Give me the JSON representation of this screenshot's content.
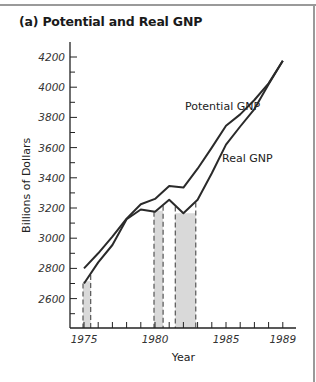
{
  "chart_data": {
    "type": "line",
    "title": "(a) Potential and Real GNP",
    "xlabel": "Year",
    "ylabel": "Billions of Dollars",
    "x": [
      1975,
      1976,
      1977,
      1978,
      1979,
      1980,
      1981,
      1982,
      1983,
      1984,
      1985,
      1986,
      1987,
      1988,
      1989
    ],
    "x_tick_labels": [
      "1975",
      "1980",
      "1985",
      "1989"
    ],
    "y_tick_labels": [
      "2600",
      "2800",
      "3000",
      "3200",
      "3400",
      "3600",
      "3800",
      "4000",
      "4200"
    ],
    "ylim": [
      2400,
      4300
    ],
    "xlim": [
      1974.0,
      1989.8
    ],
    "grid": false,
    "legend_position": "inline labels",
    "series": [
      {
        "name": "Potential GNP",
        "values": [
          2800,
          2900,
          3010,
          3130,
          3225,
          3260,
          3345,
          3335,
          3460,
          3600,
          3745,
          3820,
          3915,
          4025,
          4175
        ]
      },
      {
        "name": "Real GNP",
        "values": [
          2700,
          2840,
          2955,
          3125,
          3190,
          3175,
          3255,
          3165,
          3255,
          3430,
          3620,
          3740,
          3855,
          4020,
          4175
        ]
      }
    ],
    "shaded_regions": [
      {
        "start": 1975.0,
        "end": 1975.4,
        "label": "recession"
      },
      {
        "start": 1980.0,
        "end": 1980.5,
        "label": "recession"
      },
      {
        "start": 1981.5,
        "end": 1982.8,
        "label": "recession"
      }
    ]
  },
  "colors": {
    "line": "#2a2a2a",
    "shade": "#d9d9d9",
    "dash": "#555555",
    "frame": "#9a9a9a"
  }
}
